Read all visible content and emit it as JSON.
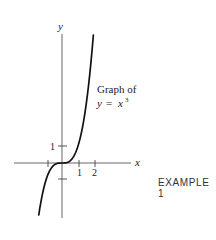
{
  "figure": {
    "caption": "EXAMPLE 1",
    "annotation_line1": "Graph of",
    "annotation_line2_lhs": "y",
    "annotation_line2_eq": "=",
    "annotation_line2_rhs": "x",
    "annotation_line2_exp": "3",
    "x_axis_label": "x",
    "y_axis_label": "y",
    "x_tick_labels": [
      "1",
      "2"
    ],
    "y_tick_labels": [
      "1"
    ],
    "colors": {
      "curve": "#111111",
      "axes": "#555555",
      "text": "#222222"
    }
  },
  "chart_data": {
    "type": "line",
    "xlabel": "x",
    "ylabel": "y",
    "function": "y = x^3",
    "x": [
      -1.45,
      -1.25,
      -1.0,
      -0.75,
      -0.5,
      -0.25,
      0,
      0.25,
      0.5,
      0.75,
      1.0,
      1.25,
      1.5,
      1.75,
      1.96
    ],
    "values": [
      -3.05,
      -1.95,
      -1.0,
      -0.42,
      -0.125,
      -0.016,
      0,
      0.016,
      0.125,
      0.42,
      1.0,
      1.95,
      3.375,
      5.36,
      7.53
    ],
    "x_ticks": [
      -1,
      1,
      2
    ],
    "x_tick_labels": [
      "",
      "1",
      "2"
    ],
    "y_ticks": [
      -1,
      1
    ],
    "y_tick_labels": [
      "",
      "1"
    ],
    "xlim": [
      -3.0,
      4.3
    ],
    "ylim": [
      -3.3,
      7.6
    ],
    "grid": false,
    "legend": null,
    "annotations": [
      "Graph of y = x^3",
      "EXAMPLE 1"
    ]
  }
}
